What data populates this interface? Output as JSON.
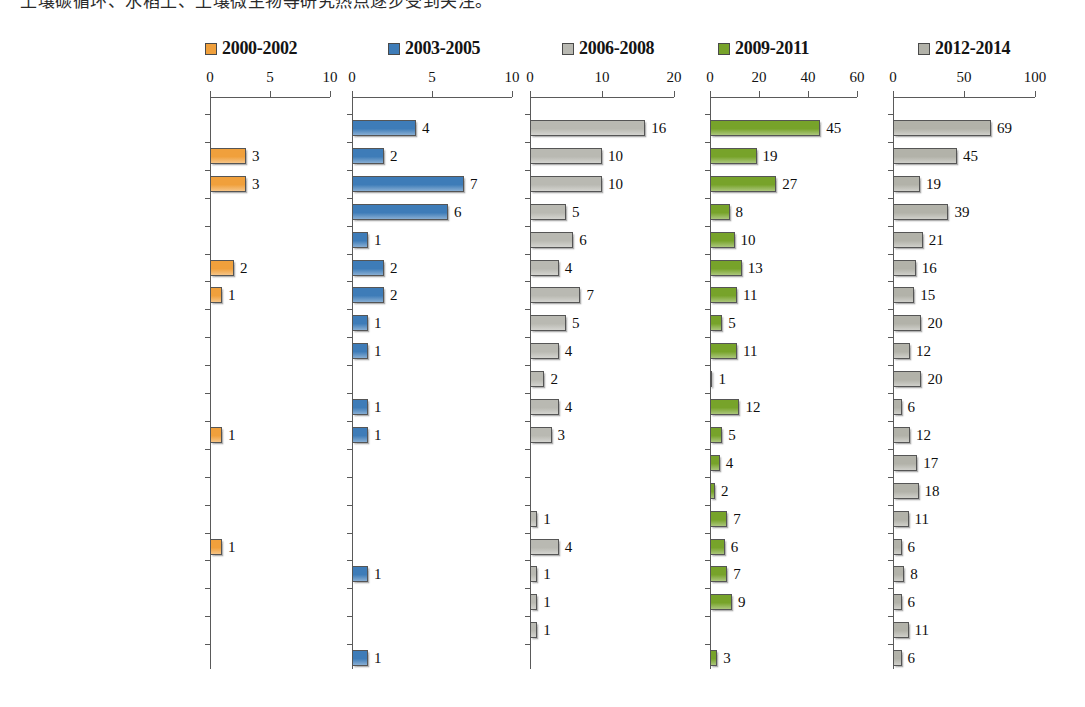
{
  "header": {
    "cropped_text": "土壤碳循环、水稻土、土壤微生物等研究热点逐步受到关注。"
  },
  "legend": {
    "items": [
      {
        "label": "2000-2002",
        "color": "#F0A03C",
        "x": 205
      },
      {
        "label": "2003-2005",
        "color": "#3E7CB8",
        "x": 388
      },
      {
        "label": "2006-2008",
        "color": "#B9B9B2",
        "x": 562
      },
      {
        "label": "2009-2011",
        "color": "#77A32A",
        "x": 718
      },
      {
        "label": "2012-2014",
        "color": "#B2B2A9",
        "x": 918
      }
    ]
  },
  "categories": [
    "土壤碳循环",
    "土壤氮循环",
    "水稻土",
    "土壤微生物",
    "氧化亚氮",
    "磷",
    "硝化作用",
    "氨氧化菌",
    "温室气体",
    "土壤微生物群落结构",
    "长期施肥",
    "反硝化",
    "生物质炭",
    "全球变化",
    "氮沉降",
    "红壤",
    "黑土",
    "甲烷氧化菌",
    "分子生物学",
    "土壤团聚体"
  ],
  "chart_data": {
    "type": "bar",
    "orientation": "horizontal",
    "title": "",
    "xlabel": "",
    "ylabel": "",
    "grid": false,
    "legend_position": "top",
    "categories": [
      "土壤碳循环",
      "土壤氮循环",
      "水稻土",
      "土壤微生物",
      "氧化亚氮",
      "磷",
      "硝化作用",
      "氨氧化菌",
      "温室气体",
      "土壤微生物群落结构",
      "长期施肥",
      "反硝化",
      "生物质炭",
      "全球变化",
      "氮沉降",
      "红壤",
      "黑土",
      "甲烷氧化菌",
      "分子生物学",
      "土壤团聚体"
    ],
    "panels": [
      {
        "name": "2000-2002",
        "color": "#F0A03C",
        "x0": 210,
        "x1": 330,
        "xlim": [
          0,
          10
        ],
        "ticks": [
          0,
          5,
          10
        ],
        "tick_labels": [
          "0",
          "5",
          "10"
        ],
        "values": [
          null,
          3,
          3,
          null,
          null,
          2,
          1,
          null,
          null,
          null,
          null,
          1,
          null,
          null,
          null,
          1,
          null,
          null,
          null,
          null
        ]
      },
      {
        "name": "2003-2005",
        "color": "#3E7CB8",
        "x0": 352,
        "x1": 512,
        "xlim": [
          0,
          10
        ],
        "ticks": [
          0,
          5,
          10
        ],
        "tick_labels": [
          "0",
          "5",
          "10"
        ],
        "values": [
          4,
          2,
          7,
          6,
          1,
          2,
          2,
          1,
          1,
          null,
          1,
          1,
          null,
          null,
          null,
          null,
          1,
          null,
          null,
          1
        ]
      },
      {
        "name": "2006-2008",
        "color": "#B9B9B2",
        "x0": 530,
        "x1": 674,
        "xlim": [
          0,
          20
        ],
        "ticks": [
          0,
          10,
          20
        ],
        "tick_labels": [
          "0",
          "10",
          "20"
        ],
        "values": [
          16,
          10,
          10,
          5,
          6,
          4,
          7,
          5,
          4,
          2,
          4,
          3,
          null,
          null,
          1,
          4,
          1,
          1,
          1,
          null
        ]
      },
      {
        "name": "2009-2011",
        "color": "#77A32A",
        "x0": 710,
        "x1": 857,
        "xlim": [
          0,
          60
        ],
        "ticks": [
          0,
          20,
          40,
          60
        ],
        "tick_labels": [
          "0",
          "20",
          "40",
          "60"
        ],
        "values": [
          45,
          19,
          27,
          8,
          10,
          13,
          11,
          5,
          11,
          1,
          12,
          5,
          4,
          2,
          7,
          6,
          7,
          9,
          null,
          3
        ]
      },
      {
        "name": "2012-2014",
        "color": "#B2B2A9",
        "x0": 893,
        "x1": 1035,
        "xlim": [
          0,
          100
        ],
        "ticks": [
          0,
          50,
          100
        ],
        "tick_labels": [
          "0",
          "50",
          "100"
        ],
        "values": [
          69,
          45,
          19,
          39,
          21,
          16,
          15,
          20,
          12,
          20,
          6,
          12,
          17,
          18,
          11,
          6,
          8,
          6,
          11,
          6
        ]
      }
    ]
  },
  "geometry": {
    "row0_y": 128,
    "row_step": 27.9,
    "axis_y": 97,
    "bar_height": 16,
    "label_col_right": 190
  }
}
